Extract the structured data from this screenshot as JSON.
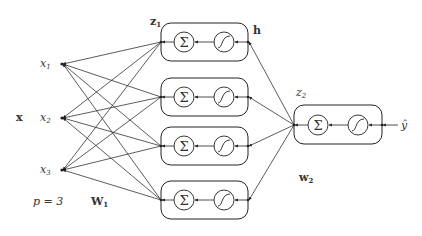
{
  "diagram": {
    "type": "neural-network",
    "colors": {
      "stroke": "#222222",
      "text": "#333333",
      "background": "#ffffff"
    },
    "labels": {
      "input_vector": "x",
      "input_count": "p = 3",
      "weights_1": "W",
      "weights_1_sub": "1",
      "hidden_preact": "z",
      "hidden_preact_sub": "1",
      "hidden_act": "h",
      "output_preact": "z",
      "output_preact_sub": "2",
      "weights_2": "w",
      "weights_2_sub": "2",
      "output": "ŷ"
    },
    "inputs": [
      {
        "label": "x",
        "sub": "1"
      },
      {
        "label": "x",
        "sub": "2"
      },
      {
        "label": "x",
        "sub": "3"
      }
    ],
    "hidden_units": [
      {
        "sum_symbol": "Σ",
        "activation": "sigmoid"
      },
      {
        "sum_symbol": "Σ",
        "activation": "sigmoid"
      },
      {
        "sum_symbol": "Σ",
        "activation": "sigmoid"
      },
      {
        "sum_symbol": "Σ",
        "activation": "sigmoid"
      }
    ],
    "output_unit": {
      "sum_symbol": "Σ",
      "activation": "sigmoid"
    }
  }
}
